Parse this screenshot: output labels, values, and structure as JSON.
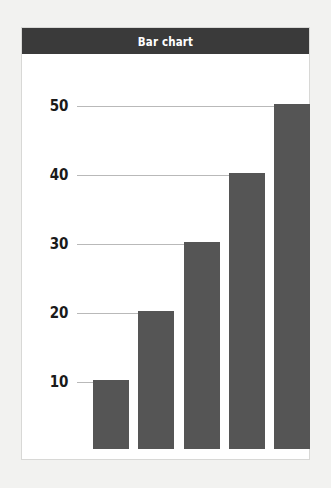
{
  "chart_data": {
    "type": "bar",
    "title": "Bar chart",
    "xlabel": "",
    "ylabel": "",
    "categories": [
      "",
      "",
      "",
      "",
      ""
    ],
    "values": [
      10,
      20,
      30,
      40,
      50
    ],
    "ylim": [
      0,
      55
    ],
    "yticks": [
      10,
      20,
      30,
      40,
      50
    ],
    "ytick_labels": [
      "10",
      "20",
      "30",
      "40",
      "50"
    ],
    "xtick_labels": [],
    "grid": "horizontal",
    "legend": "none",
    "series": [
      {
        "name": "",
        "values": [
          10,
          20,
          30,
          40,
          50
        ]
      }
    ],
    "colors": {
      "bar_fill": "#555555",
      "title_bar_background": "#3a3a3a",
      "title_text": "#ffffff",
      "gridline": "#b9b9b9",
      "tick_label": "#1a1a1a",
      "plot_background": "#ffffff",
      "page_background": "#f2f2f0",
      "frame_border": "#d8d8d6"
    }
  }
}
